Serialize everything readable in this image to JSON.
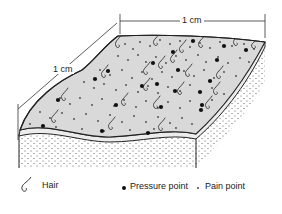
{
  "diagram": {
    "dimension_top": "1 cm",
    "dimension_left": "1 cm",
    "surface_fill": "#d9d9d9",
    "stroke": "#222222"
  },
  "legend": {
    "hair_label": "Hair",
    "pressure_label": "Pressure point",
    "pain_label": "Pain point",
    "hair_icon": "hair-icon",
    "pressure_icon": "large-dot-icon",
    "pain_icon": "small-dot-icon"
  }
}
